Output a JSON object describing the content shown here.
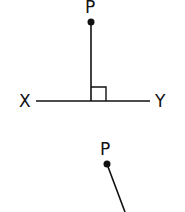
{
  "diagram": {
    "figure1": {
      "point_label": "P",
      "line_left_label": "X",
      "line_right_label": "Y",
      "right_angle_marker": true
    },
    "figure2": {
      "point_label": "P"
    },
    "colors": {
      "stroke": "#111111",
      "background": "#ffffff"
    }
  }
}
